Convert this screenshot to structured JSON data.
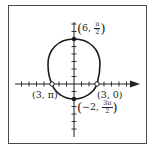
{
  "figure": {
    "type": "polar-graph",
    "border": true
  },
  "points": [
    {
      "r": "6",
      "theta_num": "π",
      "theta_den": "2",
      "label_id": "top",
      "marker": "filled"
    },
    {
      "r": "3",
      "theta": "0",
      "label_id": "right",
      "marker": "open"
    },
    {
      "r": "3",
      "theta": "π",
      "label_id": "left",
      "marker": "open"
    },
    {
      "r": "−2",
      "theta_num": "3π",
      "theta_den": "2",
      "label_id": "bottom",
      "marker": "filled"
    }
  ],
  "labels": {
    "top": {
      "r": "6,",
      "num": "π",
      "den": "2"
    },
    "right": "(3, 0)",
    "left": "(3, π)",
    "bottom": {
      "r": "−2,",
      "num": "3π",
      "den": "2"
    }
  },
  "colors": {
    "curve": "#1a1a1a",
    "axis": "#222222",
    "frame": "#4a4a4a"
  }
}
